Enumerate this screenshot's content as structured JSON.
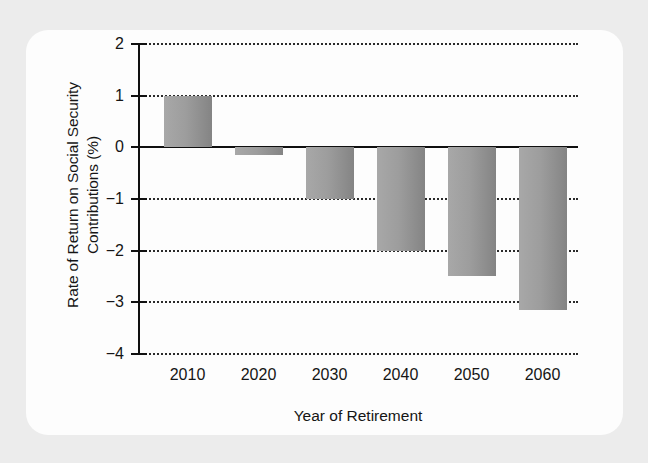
{
  "chart_data": {
    "type": "bar",
    "title": "",
    "subtitle": "",
    "xlabel": "Year of Retirement",
    "ylabel": "Rate of Return on Social Security Contributions (%)",
    "ylabel_line1": "Rate of Return on Social Security",
    "ylabel_line2": "Contributions (%)",
    "categories": [
      "2010",
      "2020",
      "2030",
      "2040",
      "2050",
      "2060"
    ],
    "values": [
      1.0,
      -0.15,
      -1.0,
      -2.0,
      -2.5,
      -3.15
    ],
    "ylim": [
      -4,
      2
    ],
    "yticks": [
      2,
      1,
      0,
      -1,
      -2,
      -3,
      -4
    ],
    "ytick_labels": [
      "2",
      "1",
      "0",
      "−1",
      "−2",
      "−3",
      "−4"
    ],
    "xticks": [
      "2010",
      "2020",
      "2030",
      "2040",
      "2050",
      "2060"
    ],
    "grid": true,
    "grid_style": "dotted-horizontal",
    "legend": false,
    "legend_position": "none",
    "zero_line": 0,
    "bar_color": "#9a9a9a",
    "bar_gradient_from": "#a8a8a8",
    "bar_gradient_to": "#848484",
    "axis_color": "#101010",
    "grid_color": "#2a2a2a",
    "text_color": "#151515",
    "card_background": "#fdfdfd",
    "page_background": "#ececec"
  }
}
